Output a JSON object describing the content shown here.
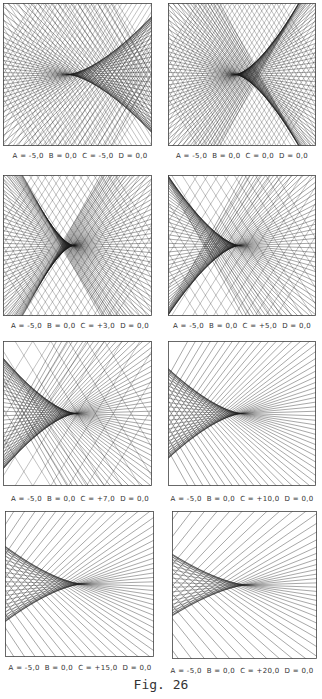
{
  "figure": {
    "caption": "Fig. 26",
    "line_color": "#1a1a1a",
    "panels": [
      {
        "id": "p1",
        "caption": "A = -5,0  B = 0,0  C = -5,0  D = 0,0",
        "A": -5.0,
        "B": 0.0,
        "C": -5.0,
        "D": 0.0,
        "box": {
          "x": 3,
          "y": 3,
          "w": 149,
          "h": 143
        },
        "caption_pos": {
          "x": 0,
          "y": 152
        }
      },
      {
        "id": "p2",
        "caption": "A = -5,0  B = 0,0  C = 0,0  D = 0,0",
        "A": -5.0,
        "B": 0.0,
        "C": 0.0,
        "D": 0.0,
        "box": {
          "x": 168,
          "y": 3,
          "w": 148,
          "h": 143
        },
        "caption_pos": {
          "x": 162,
          "y": 152
        }
      },
      {
        "id": "p3",
        "caption": "A = -5,0  B = 0,0  C = +3,0  D = 0,0",
        "A": -5.0,
        "B": 0.0,
        "C": 3.0,
        "D": 0.0,
        "box": {
          "x": 3,
          "y": 175,
          "w": 149,
          "h": 141
        },
        "caption_pos": {
          "x": 0,
          "y": 322
        }
      },
      {
        "id": "p4",
        "caption": "A = -5,0  B = 0,0  C = +5,0  D = 0,0",
        "A": -5.0,
        "B": 0.0,
        "C": 5.0,
        "D": 0.0,
        "box": {
          "x": 168,
          "y": 175,
          "w": 148,
          "h": 141
        },
        "caption_pos": {
          "x": 162,
          "y": 322
        }
      },
      {
        "id": "p5",
        "caption": "A = -5,0  B = 0,0  C = +7,0  D = 0,0",
        "A": -5.0,
        "B": 0.0,
        "C": 7.0,
        "D": 0.0,
        "box": {
          "x": 3,
          "y": 341,
          "w": 149,
          "h": 145
        },
        "caption_pos": {
          "x": 0,
          "y": 495
        }
      },
      {
        "id": "p6",
        "caption": "A = -5,0  B = 0,0  C = +10,0  D = 0,0",
        "A": -5.0,
        "B": 0.0,
        "C": 10.0,
        "D": 0.0,
        "box": {
          "x": 168,
          "y": 341,
          "w": 148,
          "h": 145
        },
        "caption_pos": {
          "x": 162,
          "y": 495
        }
      },
      {
        "id": "p7",
        "caption": "A = -5,0  B = 0,0  C = +15,0  D = 0,0",
        "A": -5.0,
        "B": 0.0,
        "C": 15.0,
        "D": 0.0,
        "box": {
          "x": 5,
          "y": 511,
          "w": 149,
          "h": 146
        },
        "caption_pos": {
          "x": 0,
          "y": 664
        }
      },
      {
        "id": "p8",
        "caption": "A = -5,0  B = 0,0  C = +20,0  D = 0,0",
        "A": -5.0,
        "B": 0.0,
        "C": 20.0,
        "D": 0.0,
        "box": {
          "x": 172,
          "y": 511,
          "w": 145,
          "h": 148
        },
        "caption_pos": {
          "x": 162,
          "y": 667
        }
      }
    ]
  }
}
